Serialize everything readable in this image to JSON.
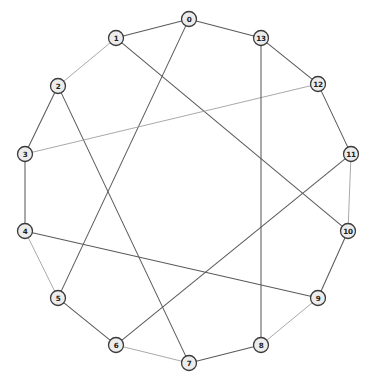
{
  "figure": {
    "kind": "node-link-graph",
    "layout": "circular",
    "width": 372,
    "height": 383,
    "background_color": "#ffffff",
    "node_fill_color": "#ececed",
    "node_stroke_color": "#3a3a3a",
    "edge_color": "#5a5a5a",
    "edge_color_faint": "#9a9a9a",
    "label_color": "#1c1c1c",
    "node_radius": 7.5
  },
  "chart_data": {
    "type": "graph",
    "title": "",
    "directed": false,
    "node_count": 14,
    "edge_count": 21,
    "degree": 3,
    "nodes": [
      {
        "id": "0",
        "label": "0",
        "x": 189,
        "y": 19
      },
      {
        "id": "1",
        "label": "1",
        "x": 116,
        "y": 38
      },
      {
        "id": "2",
        "label": "2",
        "x": 58,
        "y": 86
      },
      {
        "id": "3",
        "label": "3",
        "x": 25,
        "y": 154
      },
      {
        "id": "4",
        "label": "4",
        "x": 25,
        "y": 231
      },
      {
        "id": "5",
        "label": "5",
        "x": 58,
        "y": 298
      },
      {
        "id": "6",
        "label": "6",
        "x": 116,
        "y": 345
      },
      {
        "id": "7",
        "label": "7",
        "x": 189,
        "y": 363
      },
      {
        "id": "8",
        "label": "8",
        "x": 261,
        "y": 345
      },
      {
        "id": "9",
        "label": "9",
        "x": 318,
        "y": 298
      },
      {
        "id": "10",
        "label": "10",
        "x": 348,
        "y": 231
      },
      {
        "id": "11",
        "label": "11",
        "x": 351,
        "y": 154
      },
      {
        "id": "12",
        "label": "12",
        "x": 318,
        "y": 84
      },
      {
        "id": "13",
        "label": "13",
        "x": 261,
        "y": 38
      }
    ],
    "edges": [
      {
        "source": "0",
        "target": "1",
        "style": "normal"
      },
      {
        "source": "1",
        "target": "2",
        "style": "faint"
      },
      {
        "source": "2",
        "target": "3",
        "style": "normal"
      },
      {
        "source": "3",
        "target": "4",
        "style": "normal"
      },
      {
        "source": "4",
        "target": "5",
        "style": "faint"
      },
      {
        "source": "5",
        "target": "6",
        "style": "normal"
      },
      {
        "source": "6",
        "target": "7",
        "style": "faint"
      },
      {
        "source": "7",
        "target": "8",
        "style": "normal"
      },
      {
        "source": "8",
        "target": "9",
        "style": "faint"
      },
      {
        "source": "9",
        "target": "10",
        "style": "normal"
      },
      {
        "source": "10",
        "target": "11",
        "style": "faint"
      },
      {
        "source": "11",
        "target": "12",
        "style": "normal"
      },
      {
        "source": "12",
        "target": "13",
        "style": "normal"
      },
      {
        "source": "13",
        "target": "0",
        "style": "normal"
      },
      {
        "source": "0",
        "target": "5",
        "style": "normal"
      },
      {
        "source": "1",
        "target": "10",
        "style": "normal"
      },
      {
        "source": "2",
        "target": "7",
        "style": "normal"
      },
      {
        "source": "3",
        "target": "12",
        "style": "faint"
      },
      {
        "source": "4",
        "target": "9",
        "style": "normal"
      },
      {
        "source": "6",
        "target": "11",
        "style": "normal"
      },
      {
        "source": "8",
        "target": "13",
        "style": "normal"
      }
    ]
  }
}
